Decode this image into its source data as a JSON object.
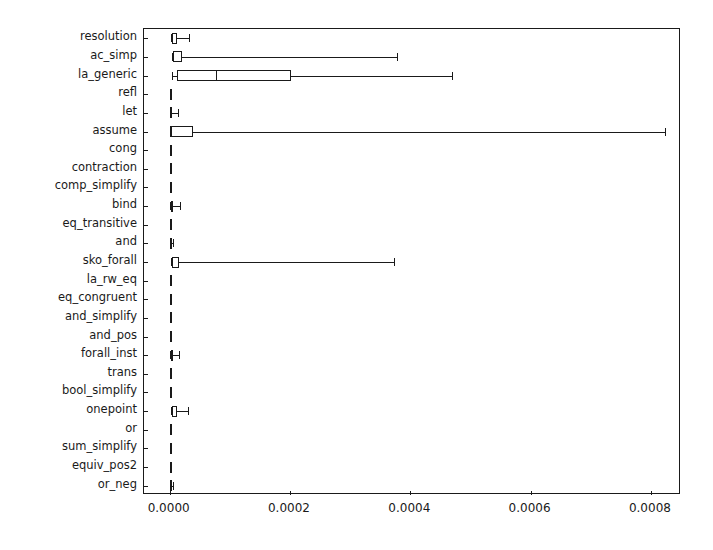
{
  "chart_data": {
    "type": "box",
    "orientation": "horizontal",
    "title": "",
    "xlabel": "",
    "ylabel": "",
    "xlim": [
      -4.27e-05,
      0.00085
    ],
    "xticks": [
      0.0,
      0.0002,
      0.0004,
      0.0006,
      0.0008
    ],
    "xticklabels": [
      "0.0000",
      "0.0002",
      "0.0004",
      "0.0006",
      "0.0008"
    ],
    "grid": false,
    "legend": null,
    "categories": [
      "resolution",
      "ac_simp",
      "la_generic",
      "refl",
      "let",
      "assume",
      "cong",
      "contraction",
      "comp_simplify",
      "bind",
      "eq_transitive",
      "and",
      "sko_forall",
      "la_rw_eq",
      "eq_congruent",
      "and_simplify",
      "and_pos",
      "forall_inst",
      "trans",
      "bool_simplify",
      "onepoint",
      "or",
      "sum_simplify",
      "equiv_pos2",
      "or_neg"
    ],
    "boxes": [
      {
        "label": "resolution",
        "whislo": 2.5e-06,
        "q1": 3.5e-06,
        "med": 4.5e-06,
        "q3": 1.25e-05,
        "whishi": 3.18e-05
      },
      {
        "label": "ac_simp",
        "whislo": 4e-06,
        "q1": 5.2e-06,
        "med": 6.2e-06,
        "q3": 2e-05,
        "whishi": 0.0003785
      },
      {
        "label": "la_generic",
        "whislo": 4.3e-06,
        "q1": 1.27e-05,
        "med": 7.65e-05,
        "q3": 0.0002015,
        "whishi": 0.000469
      },
      {
        "label": "refl",
        "whislo": 8e-07,
        "q1": 1.1e-06,
        "med": 1.3e-06,
        "q3": 1.7e-06,
        "whishi": 2.6e-06
      },
      {
        "label": "let",
        "whislo": 9e-07,
        "q1": 1.3e-06,
        "med": 1.6e-06,
        "q3": 3.1e-06,
        "whishi": 1.4e-05
      },
      {
        "label": "assume",
        "whislo": 8e-07,
        "q1": 1.2e-06,
        "med": 1.6e-06,
        "q3": 3.9e-05,
        "whishi": 0.000823
      },
      {
        "label": "cong",
        "whislo": 9e-07,
        "q1": 1.1e-06,
        "med": 1.2e-06,
        "q3": 1.4e-06,
        "whishi": 1.8e-06
      },
      {
        "label": "contraction",
        "whislo": 8e-07,
        "q1": 1e-06,
        "med": 1.2e-06,
        "q3": 1.4e-06,
        "whishi": 1.9e-06
      },
      {
        "label": "comp_simplify",
        "whislo": 8e-07,
        "q1": 1e-06,
        "med": 1.2e-06,
        "q3": 1.5e-06,
        "whishi": 2.1e-06
      },
      {
        "label": "bind",
        "whislo": 1e-06,
        "q1": 1.4e-06,
        "med": 1.8e-06,
        "q3": 3.8e-06,
        "whishi": 1.7e-05
      },
      {
        "label": "eq_transitive",
        "whislo": 8e-07,
        "q1": 1e-06,
        "med": 1.2e-06,
        "q3": 1.5e-06,
        "whishi": 2.2e-06
      },
      {
        "label": "and",
        "whislo": 9e-07,
        "q1": 1.2e-06,
        "med": 1.4e-06,
        "q3": 2e-06,
        "whishi": 5.2e-06
      },
      {
        "label": "sko_forall",
        "whislo": 2.5e-06,
        "q1": 3.7e-06,
        "med": 4.6e-06,
        "q3": 1.5e-05,
        "whishi": 0.0003725
      },
      {
        "label": "la_rw_eq",
        "whislo": 9e-07,
        "q1": 1.1e-06,
        "med": 1.3e-06,
        "q3": 1.5e-06,
        "whishi": 1.9e-06
      },
      {
        "label": "eq_congruent",
        "whislo": 8e-07,
        "q1": 1.1e-06,
        "med": 1.3e-06,
        "q3": 1.6e-06,
        "whishi": 2.3e-06
      },
      {
        "label": "and_simplify",
        "whislo": 8e-07,
        "q1": 1.1e-06,
        "med": 1.3e-06,
        "q3": 1.6e-06,
        "whishi": 2.4e-06
      },
      {
        "label": "and_pos",
        "whislo": 9e-07,
        "q1": 1.1e-06,
        "med": 1.3e-06,
        "q3": 1.5e-06,
        "whishi": 2e-06
      },
      {
        "label": "forall_inst",
        "whislo": 1.3e-06,
        "q1": 2e-06,
        "med": 2.6e-06,
        "q3": 4.7e-06,
        "whishi": 1.55e-05
      },
      {
        "label": "trans",
        "whislo": 8e-07,
        "q1": 1e-06,
        "med": 1.2e-06,
        "q3": 1.4e-06,
        "whishi": 1.9e-06
      },
      {
        "label": "bool_simplify",
        "whislo": 8e-07,
        "q1": 1.1e-06,
        "med": 1.3e-06,
        "q3": 1.6e-06,
        "whishi": 2.4e-06
      },
      {
        "label": "onepoint",
        "whislo": 2.3e-06,
        "q1": 3.4e-06,
        "med": 4.3e-06,
        "q3": 1.18e-05,
        "whishi": 3.1e-05
      },
      {
        "label": "or",
        "whislo": 9e-07,
        "q1": 1.1e-06,
        "med": 1.3e-06,
        "q3": 1.5e-06,
        "whishi": 1.9e-06
      },
      {
        "label": "sum_simplify",
        "whislo": 8e-07,
        "q1": 1.1e-06,
        "med": 1.4e-06,
        "q3": 1.8e-06,
        "whishi": 2.8e-06
      },
      {
        "label": "equiv_pos2",
        "whislo": 8e-07,
        "q1": 1e-06,
        "med": 1.2e-06,
        "q3": 1.4e-06,
        "whishi": 1.9e-06
      },
      {
        "label": "or_neg",
        "whislo": 9e-07,
        "q1": 1.3e-06,
        "med": 1.6e-06,
        "q3": 2.2e-06,
        "whishi": 5.5e-06
      }
    ]
  },
  "style": {
    "line_color": "#1a1a1a",
    "box_fill": "none",
    "background": "#ffffff"
  }
}
